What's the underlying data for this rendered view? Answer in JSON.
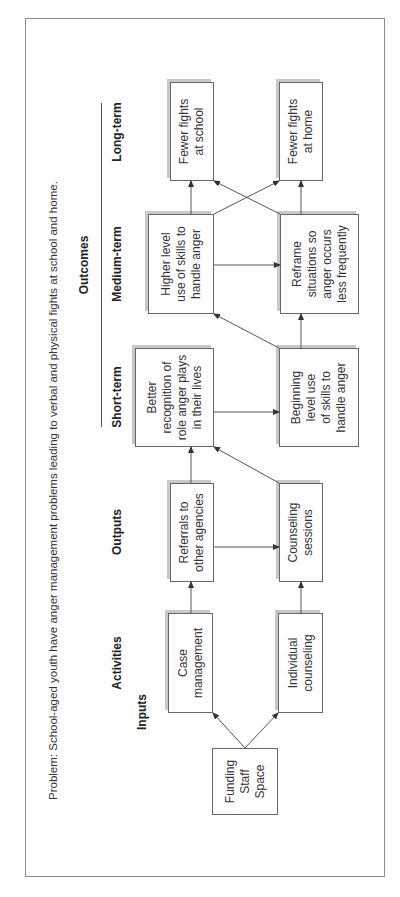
{
  "problem": "Problem: School-aged youth have anger management problems leading to verbal and physical fights at school and home.",
  "headers": {
    "inputs": "Inputs",
    "activities": "Activities",
    "outputs": "Outputs",
    "outcomes": "Outcomes",
    "short_term": "Short-term",
    "medium_term": "Medium-term",
    "long_term": "Long-term"
  },
  "boxes": {
    "inputs": "Funding\nStaff\nSpace",
    "case_management": "Case\nmanagement",
    "individual_counseling": "Individual\ncounseling",
    "referrals": "Referrals to\nother agencies",
    "counseling_sessions": "Counseling\nsessions",
    "better_recognition": "Better\nrecognition of\nrole anger plays\nin their lives",
    "beginning_level": "Beginning\nlevel use\nof skills to\nhandle anger",
    "higher_level": "Higher level\nuse of skills to\nhandle anger",
    "reframe": "Reframe\nsituations so\nanger occurs\nless frequently",
    "fewer_fights_school": "Fewer fights\nat school",
    "fewer_fights_home": "Fewer fights\nat home"
  },
  "colors": {
    "line": "#555555",
    "border": "#666666",
    "shadow": "#c8c8c8"
  }
}
